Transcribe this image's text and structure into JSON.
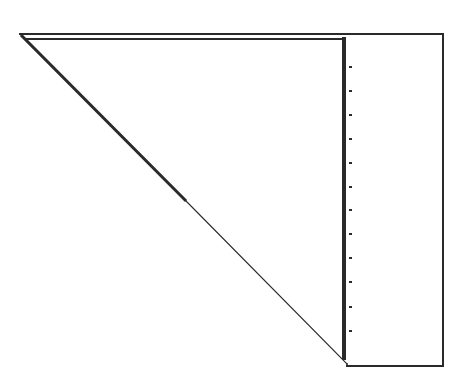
{
  "diagram": {
    "colors": {
      "background": "#ffffff",
      "stroke": "#2a2a2a"
    },
    "outer_top_line": {
      "x1": 20,
      "y1": 34,
      "x2": 443,
      "y2": 34
    },
    "inner_top_line": {
      "x1": 27,
      "y1": 39,
      "x2": 344,
      "y2": 39
    },
    "hypotenuse_thick": {
      "x1": 22,
      "y1": 36,
      "x2": 185,
      "y2": 200
    },
    "hypotenuse_thin": {
      "x1": 185,
      "y1": 200,
      "x2": 347,
      "y2": 364
    },
    "shared_vertical_edge": {
      "x": 344,
      "y1": 39,
      "y2": 358
    },
    "rectangle": {
      "x1": 344,
      "y1": 34,
      "x2": 443,
      "y2": 366
    },
    "tick_marks": {
      "x": 349,
      "length": 3,
      "count": 12,
      "y_positions": [
        67,
        91,
        115,
        139,
        163,
        187,
        210,
        234,
        258,
        282,
        307,
        331
      ]
    }
  }
}
